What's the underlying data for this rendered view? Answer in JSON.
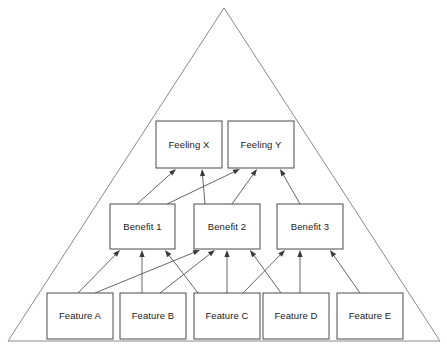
{
  "diagram": {
    "background_color": "#ffffff",
    "outline_color": "#8a8a8a",
    "box_stroke_color": "#4a4a4a",
    "box_fill_color": "#ffffff",
    "arrow_color": "#555555",
    "text_color": "#1a1a1a",
    "pyramid": {
      "apex_x": 224,
      "apex_y": 8,
      "base_left_x": 8,
      "base_right_x": 440,
      "base_y": 341
    },
    "levels": [
      {
        "name": "feelings",
        "label": "Feelings",
        "row_top": 121,
        "row_bottom": 168,
        "nodes": [
          {
            "id": "feeling_x",
            "label": "Feeling X",
            "x": 156,
            "y": 121,
            "w": 66,
            "h": 47
          },
          {
            "id": "feeling_y",
            "label": "Feeling Y",
            "x": 228,
            "y": 121,
            "w": 66,
            "h": 47
          }
        ]
      },
      {
        "name": "benefits",
        "label": "Benefits",
        "row_top": 204,
        "row_bottom": 249,
        "nodes": [
          {
            "id": "benefit_1",
            "label": "Benefit 1",
            "x": 110,
            "y": 204,
            "w": 65,
            "h": 45
          },
          {
            "id": "benefit_2",
            "label": "Benefit 2",
            "x": 194,
            "y": 204,
            "w": 66,
            "h": 45
          },
          {
            "id": "benefit_3",
            "label": "Benefit 3",
            "x": 277,
            "y": 204,
            "w": 66,
            "h": 45
          }
        ]
      },
      {
        "name": "features",
        "label": "Features",
        "row_top": 293,
        "row_bottom": 339,
        "nodes": [
          {
            "id": "feature_a",
            "label": "Feature A",
            "x": 47,
            "y": 293,
            "w": 66,
            "h": 46
          },
          {
            "id": "feature_b",
            "label": "Feature B",
            "x": 120,
            "y": 293,
            "w": 66,
            "h": 46
          },
          {
            "id": "feature_c",
            "label": "Feature C",
            "x": 194,
            "y": 293,
            "w": 66,
            "h": 46
          },
          {
            "id": "feature_d",
            "label": "Feature D",
            "x": 263,
            "y": 293,
            "w": 66,
            "h": 46
          },
          {
            "id": "feature_e",
            "label": "Feature E",
            "x": 337,
            "y": 293,
            "w": 66,
            "h": 46
          }
        ]
      }
    ],
    "links": [
      {
        "from": "benefit_1",
        "to": "feeling_x",
        "x1": 137,
        "y1": 204,
        "x2": 176,
        "y2": 169
      },
      {
        "from": "benefit_1",
        "to": "feeling_y",
        "x1": 167,
        "y1": 204,
        "x2": 240,
        "y2": 169
      },
      {
        "from": "benefit_2",
        "to": "feeling_x",
        "x1": 205,
        "y1": 204,
        "x2": 202,
        "y2": 169
      },
      {
        "from": "benefit_2",
        "to": "feeling_y",
        "x1": 232,
        "y1": 204,
        "x2": 257,
        "y2": 169
      },
      {
        "from": "benefit_3",
        "to": "feeling_y",
        "x1": 300,
        "y1": 204,
        "x2": 280,
        "y2": 169
      },
      {
        "from": "feature_a",
        "to": "benefit_1",
        "x1": 78,
        "y1": 293,
        "x2": 120,
        "y2": 250
      },
      {
        "from": "feature_b",
        "to": "benefit_1",
        "x1": 142,
        "y1": 293,
        "x2": 142,
        "y2": 250
      },
      {
        "from": "feature_c",
        "to": "benefit_1",
        "x1": 198,
        "y1": 293,
        "x2": 165,
        "y2": 250
      },
      {
        "from": "feature_a",
        "to": "benefit_2",
        "x1": 95,
        "y1": 293,
        "x2": 200,
        "y2": 250
      },
      {
        "from": "feature_b",
        "to": "benefit_2",
        "x1": 160,
        "y1": 293,
        "x2": 215,
        "y2": 250
      },
      {
        "from": "feature_c",
        "to": "benefit_2",
        "x1": 227,
        "y1": 293,
        "x2": 227,
        "y2": 250
      },
      {
        "from": "feature_d",
        "to": "benefit_2",
        "x1": 281,
        "y1": 293,
        "x2": 250,
        "y2": 250
      },
      {
        "from": "feature_c",
        "to": "benefit_3",
        "x1": 243,
        "y1": 293,
        "x2": 285,
        "y2": 250
      },
      {
        "from": "feature_d",
        "to": "benefit_3",
        "x1": 300,
        "y1": 293,
        "x2": 300,
        "y2": 250
      },
      {
        "from": "feature_e",
        "to": "benefit_3",
        "x1": 360,
        "y1": 293,
        "x2": 330,
        "y2": 250
      }
    ]
  }
}
